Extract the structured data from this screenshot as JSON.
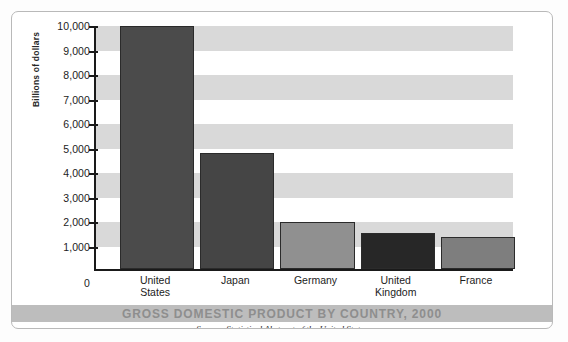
{
  "chart_data": {
    "type": "bar",
    "title": "GROSS DOMESTIC PRODUCT BY COUNTRY, 2000",
    "source": "Source: Statistical Abstract of the United States",
    "xlabel": "",
    "ylabel": "Billions of dollars",
    "ylim": [
      0,
      10000
    ],
    "ytick_step": 1000,
    "grid": "alternating horizontal bands every 1,000 units",
    "legend": "none",
    "categories": [
      "United States",
      "Japan",
      "Germany",
      "United Kingdom",
      "France"
    ],
    "category_lines": [
      [
        "United",
        "States"
      ],
      [
        "Japan"
      ],
      [
        "Germany"
      ],
      [
        "United",
        "Kingdom"
      ],
      [
        "France"
      ]
    ],
    "values": [
      9900,
      4750,
      1900,
      1480,
      1320
    ],
    "ytick_labels": [
      "10,000",
      "9,000",
      "8,000",
      "7,000",
      "6,000",
      "5,000",
      "4,000",
      "3,000",
      "2,000",
      "1,000",
      "0"
    ],
    "ytick_values": [
      10000,
      9000,
      8000,
      7000,
      6000,
      5000,
      4000,
      3000,
      2000,
      1000,
      0
    ],
    "bar_colors": [
      "#4b4b4b",
      "#454545",
      "#909090",
      "#272727",
      "#7e7e7e"
    ]
  },
  "colors": {
    "band": "#d9d9d9",
    "axis": "#1a1a1a",
    "title_band": "#bdbdbd",
    "title_text": "#8e8e8e",
    "frame": "#b9b9b9"
  }
}
